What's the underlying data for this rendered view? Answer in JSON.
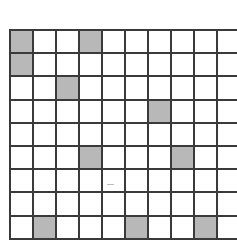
{
  "grid": {
    "columns": 10,
    "rows": 9,
    "colors": {
      "line": "#3a3a3a",
      "empty": "#ffffff",
      "shaded": "#b8b8b8"
    },
    "shaded_cells": [
      {
        "row": 0,
        "col": 0
      },
      {
        "row": 0,
        "col": 3
      },
      {
        "row": 1,
        "col": 0
      },
      {
        "row": 2,
        "col": 2
      },
      {
        "row": 3,
        "col": 6
      },
      {
        "row": 5,
        "col": 3
      },
      {
        "row": 5,
        "col": 7
      },
      {
        "row": 8,
        "col": 1
      },
      {
        "row": 8,
        "col": 5
      },
      {
        "row": 8,
        "col": 8
      }
    ]
  }
}
